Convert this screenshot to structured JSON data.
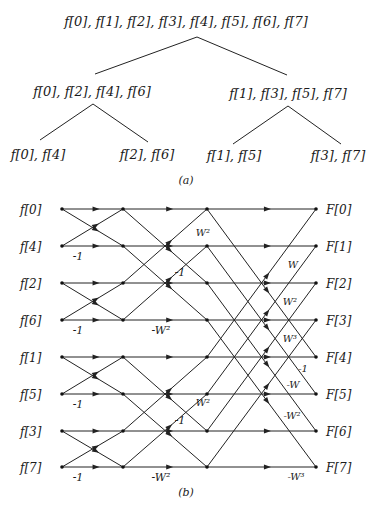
{
  "tree": {
    "root": "f[0], f[1], f[2], f[3], f[4], f[5], f[6], f[7]",
    "level1": [
      "f[0], f[2], f[4], f[6]",
      "f[1], f[3], f[5], f[7]"
    ],
    "level2": [
      "f[0], f[4]",
      "f[2], f[6]",
      "f[1], f[5]",
      "f[3], f[7]"
    ],
    "caption": "(a)"
  },
  "butterfly": {
    "inputs": [
      "f[0]",
      "f[4]",
      "f[2]",
      "f[6]",
      "f[1]",
      "f[5]",
      "f[3]",
      "f[7]"
    ],
    "outputs": [
      "F[0]",
      "F[1]",
      "F[2]",
      "F[3]",
      "F[4]",
      "F[5]",
      "F[6]",
      "F[7]"
    ],
    "stage1_weights": [
      "-1",
      "-1",
      "-1",
      "-1"
    ],
    "stage2_weights": [
      "-1",
      "-W²",
      "W²",
      "-1",
      "-W²"
    ],
    "stage3_weights": [
      "W",
      "W²",
      "W³",
      "-1",
      "-W",
      "-W²",
      "-W³"
    ],
    "w2_label_upper": "W²",
    "caption": "(b)"
  }
}
